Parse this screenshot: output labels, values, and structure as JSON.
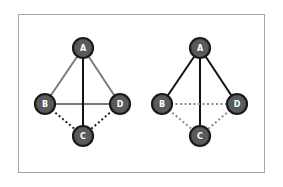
{
  "colors": {
    "node_fill": "#5a5a5a",
    "node_stroke": "#1a1a1a",
    "grey_edge": "#7a7a7a",
    "black_edge": "#111111",
    "dotted_dark": "#222222",
    "dotted_light": "#8a8a8a",
    "frame_border": "#a6a6a6"
  },
  "graphs": [
    {
      "name": "left-graph",
      "nodes": [
        {
          "id": "A",
          "label": "A",
          "x": 83,
          "y": 48
        },
        {
          "id": "B",
          "label": "B",
          "x": 45,
          "y": 104
        },
        {
          "id": "D",
          "label": "D",
          "x": 120,
          "y": 104
        },
        {
          "id": "C",
          "label": "C",
          "x": 83,
          "y": 136
        }
      ],
      "edges": [
        {
          "from": "A",
          "to": "B",
          "style": "solid-grey"
        },
        {
          "from": "A",
          "to": "D",
          "style": "solid-grey"
        },
        {
          "from": "B",
          "to": "D",
          "style": "solid-grey"
        },
        {
          "from": "A",
          "to": "C",
          "style": "solid-black"
        },
        {
          "from": "B",
          "to": "C",
          "style": "dotted-dark"
        },
        {
          "from": "D",
          "to": "C",
          "style": "dotted-dark"
        }
      ]
    },
    {
      "name": "right-graph",
      "nodes": [
        {
          "id": "A",
          "label": "A",
          "x": 200,
          "y": 48
        },
        {
          "id": "B",
          "label": "B",
          "x": 162,
          "y": 104
        },
        {
          "id": "D",
          "label": "D",
          "x": 237,
          "y": 104
        },
        {
          "id": "C",
          "label": "C",
          "x": 200,
          "y": 136
        }
      ],
      "edges": [
        {
          "from": "A",
          "to": "B",
          "style": "solid-black"
        },
        {
          "from": "A",
          "to": "D",
          "style": "solid-black"
        },
        {
          "from": "A",
          "to": "C",
          "style": "solid-black"
        },
        {
          "from": "B",
          "to": "D",
          "style": "dotted-light"
        },
        {
          "from": "B",
          "to": "C",
          "style": "dotted-light"
        },
        {
          "from": "D",
          "to": "C",
          "style": "dotted-light"
        }
      ]
    }
  ]
}
